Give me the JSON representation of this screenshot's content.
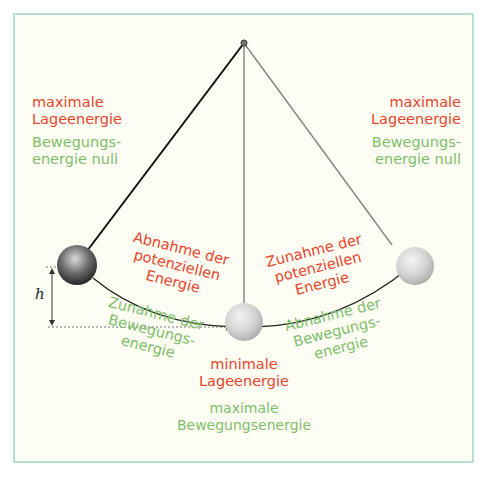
{
  "colors": {
    "potential_energy": "#e8452c",
    "kinetic_energy": "#7dbf6a",
    "frame_border": "#b9dcd3",
    "background": "#fdfdf4"
  },
  "left_extreme": {
    "potential_label_1": "maximale",
    "potential_label_2": "Lageenergie",
    "kinetic_label_1": "Bewegungs-",
    "kinetic_label_2": "energie null"
  },
  "right_extreme": {
    "potential_label_1": "maximale",
    "potential_label_2": "Lageenergie",
    "kinetic_label_1": "Bewegungs-",
    "kinetic_label_2": "energie null"
  },
  "downswing": {
    "potential_label_1": "Abnahme der",
    "potential_label_2": "potenziellen",
    "potential_label_3": "Energie",
    "kinetic_label_1": "Zunahme der",
    "kinetic_label_2": "Bewegungs-",
    "kinetic_label_3": "energie"
  },
  "upswing": {
    "potential_label_1": "Zunahme der",
    "potential_label_2": "potenziellen",
    "potential_label_3": "Energie",
    "kinetic_label_1": "Abnahme der",
    "kinetic_label_2": "Bewegungs-",
    "kinetic_label_3": "energie"
  },
  "bottom": {
    "potential_label_1": "minimale",
    "potential_label_2": "Lageenergie",
    "kinetic_label_1": "maximale",
    "kinetic_label_2": "Bewegungsenergie"
  },
  "height_label": "h"
}
